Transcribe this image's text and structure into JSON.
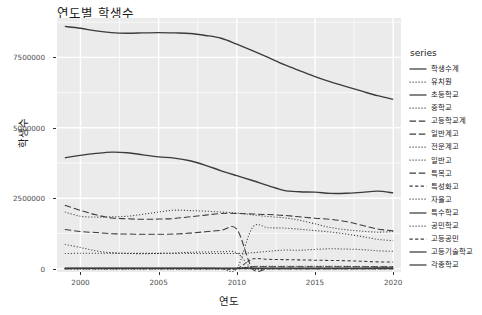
{
  "chart_data": {
    "type": "line",
    "title": "연도별 학생수",
    "xlabel": "연도",
    "ylabel": "학생수",
    "legend_title": "series",
    "legend_position": "right",
    "grid": true,
    "panel_color": "#EBEBEB",
    "grid_color": "#FFFFFF",
    "line_color": "#3B3B3B",
    "xlim": [
      1998.5,
      2020.5
    ],
    "ylim": [
      -120000,
      8900000
    ],
    "xticks": [
      2000,
      2005,
      2010,
      2015,
      2020
    ],
    "xtick_labels": [
      "2000",
      "2005",
      "2010",
      "2015",
      "2020"
    ],
    "yticks": [
      0,
      2500000,
      5000000,
      7500000
    ],
    "ytick_labels": [
      "0",
      "2500000",
      "5000000",
      "7500000"
    ],
    "x": [
      1999,
      2000,
      2001,
      2002,
      2003,
      2004,
      2005,
      2006,
      2007,
      2008,
      2009,
      2010,
      2011,
      2012,
      2013,
      2014,
      2015,
      2016,
      2017,
      2018,
      2019,
      2020
    ],
    "series": [
      {
        "name": "학생수계",
        "dash": "solid",
        "values": [
          8600000,
          8535000,
          8440000,
          8380000,
          8360000,
          8370000,
          8380000,
          8370000,
          8350000,
          8280000,
          8180000,
          7970000,
          7740000,
          7500000,
          7250000,
          7030000,
          6820000,
          6630000,
          6460000,
          6300000,
          6140000,
          6010000
        ]
      },
      {
        "name": "유치원",
        "dash": "dotted",
        "values": [
          534000,
          546000,
          545000,
          550000,
          546000,
          541000,
          542000,
          546000,
          541000,
          538000,
          538000,
          538000,
          564000,
          614000,
          658000,
          653000,
          683000,
          704000,
          694000,
          675000,
          634000,
          612000
        ]
      },
      {
        "name": "초등학교",
        "dash": "solid",
        "values": [
          3935000,
          4020000,
          4090000,
          4138000,
          4116000,
          4040000,
          3970000,
          3925000,
          3830000,
          3670000,
          3475000,
          3300000,
          3130000,
          2950000,
          2780000,
          2730000,
          2715000,
          2670000,
          2675000,
          2710000,
          2750000,
          2690000
        ]
      },
      {
        "name": "중학교",
        "dash": "dotted",
        "values": [
          2010000,
          1860000,
          1830000,
          1840000,
          1860000,
          1930000,
          2010000,
          2075000,
          2060000,
          2040000,
          2010000,
          1975000,
          1910000,
          1850000,
          1805000,
          1720000,
          1590000,
          1460000,
          1380000,
          1330000,
          1295000,
          1315000
        ]
      },
      {
        "name": "고등학교계",
        "dash": "longdash",
        "values": [
          2250000,
          2070000,
          1910000,
          1800000,
          1770000,
          1750000,
          1760000,
          1780000,
          1840000,
          1900000,
          1960000,
          1960000,
          1940000,
          1920000,
          1890000,
          1840000,
          1790000,
          1750000,
          1670000,
          1540000,
          1410000,
          1340000
        ]
      },
      {
        "name": "일반계고",
        "dash": "longdash",
        "values": [
          1390000,
          1320000,
          1280000,
          1240000,
          1230000,
          1220000,
          1220000,
          1230000,
          1260000,
          1310000,
          1360000,
          1400000,
          0,
          0,
          0,
          0,
          0,
          0,
          0,
          0,
          0,
          0
        ]
      },
      {
        "name": "전문계고",
        "dash": "dotted",
        "values": [
          860000,
          750000,
          630000,
          560000,
          540000,
          530000,
          540000,
          550000,
          580000,
          590000,
          600000,
          560000,
          0,
          0,
          0,
          0,
          0,
          0,
          0,
          0,
          0,
          0
        ]
      },
      {
        "name": "일반고",
        "dash": "dotted",
        "values": [
          0,
          0,
          0,
          0,
          0,
          0,
          0,
          0,
          0,
          0,
          0,
          0,
          1460000,
          1450000,
          1440000,
          1400000,
          1350000,
          1300000,
          1230000,
          1140000,
          1040000,
          990000
        ]
      },
      {
        "name": "특목고",
        "dash": "longdash",
        "values": [
          0,
          0,
          0,
          0,
          0,
          0,
          0,
          0,
          0,
          0,
          0,
          0,
          64000,
          65000,
          66000,
          67000,
          67000,
          67000,
          67000,
          66000,
          64000,
          63000
        ]
      },
      {
        "name": "특성화고",
        "dash": "dashed",
        "values": [
          0,
          0,
          0,
          0,
          0,
          0,
          0,
          0,
          0,
          0,
          0,
          0,
          340000,
          330000,
          320000,
          310000,
          300000,
          290000,
          280000,
          260000,
          240000,
          230000
        ]
      },
      {
        "name": "자율고",
        "dash": "dotted",
        "values": [
          0,
          0,
          0,
          0,
          0,
          0,
          0,
          0,
          0,
          0,
          0,
          0,
          76000,
          80000,
          84000,
          86000,
          84000,
          82000,
          80000,
          76000,
          70000,
          64000
        ]
      },
      {
        "name": "특수학교",
        "dash": "solid",
        "values": [
          23000,
          23500,
          23800,
          23900,
          23900,
          23700,
          23400,
          23300,
          23000,
          23200,
          23300,
          23300,
          24500,
          24800,
          25100,
          25300,
          25500,
          25600,
          25500,
          25600,
          25800,
          25800
        ]
      },
      {
        "name": "공민학교",
        "dash": "dotted",
        "values": [
          300,
          280,
          250,
          230,
          210,
          200,
          190,
          180,
          170,
          160,
          150,
          140,
          130,
          120,
          110,
          100,
          95,
          90,
          85,
          80,
          75,
          70
        ]
      },
      {
        "name": "고등공민",
        "dash": "dashed",
        "values": [
          1800,
          1700,
          1600,
          1500,
          1400,
          1300,
          1200,
          1100,
          1000,
          950,
          900,
          850,
          800,
          750,
          700,
          650,
          600,
          550,
          500,
          460,
          420,
          400
        ]
      },
      {
        "name": "고등기술학교",
        "dash": "solid",
        "values": [
          5200,
          4900,
          4600,
          4300,
          4000,
          3800,
          3600,
          3400,
          3200,
          3000,
          2800,
          2600,
          2400,
          2200,
          2100,
          2000,
          1900,
          1800,
          1700,
          1600,
          1500,
          1400
        ]
      },
      {
        "name": "각종학교",
        "dash": "solid",
        "values": [
          10500,
          10200,
          9900,
          9600,
          9300,
          9000,
          8800,
          8600,
          8400,
          8200,
          8000,
          7800,
          7600,
          7400,
          7300,
          7200,
          7100,
          7000,
          6900,
          6800,
          6700,
          6600
        ]
      }
    ]
  }
}
